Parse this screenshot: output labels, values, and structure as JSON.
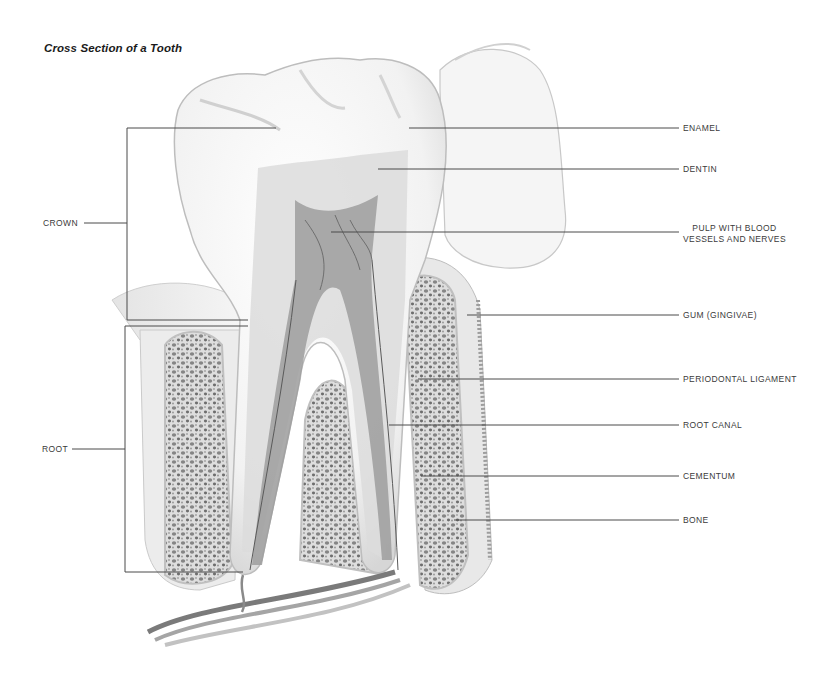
{
  "title": "Cross Section of a Tooth",
  "groups": {
    "crown": "CROWN",
    "root": "ROOT"
  },
  "labels": [
    {
      "id": "enamel",
      "text": "ENAMEL"
    },
    {
      "id": "dentin",
      "text": "DENTIN"
    },
    {
      "id": "pulp",
      "line1": "PULP WITH BLOOD",
      "line2": "VESSELS AND NERVES"
    },
    {
      "id": "gum",
      "text": "GUM (GINGIVAE)"
    },
    {
      "id": "periodontal-ligament",
      "text": "PERIODONTAL LIGAMENT"
    },
    {
      "id": "root-canal",
      "text": "ROOT CANAL"
    },
    {
      "id": "cementum",
      "text": "CEMENTUM"
    },
    {
      "id": "bone",
      "text": "BONE"
    }
  ],
  "colors": {
    "leader_line": "#4a4a4a",
    "enamel": "#f7f7f7",
    "dentin": "#dcdcdc",
    "pulp": "#9a9a9a",
    "bone": "#d8d8d8",
    "bone_spots": "#7a7a7a",
    "gum": "#cfcfcf",
    "vessel": "#8a8a8a"
  }
}
